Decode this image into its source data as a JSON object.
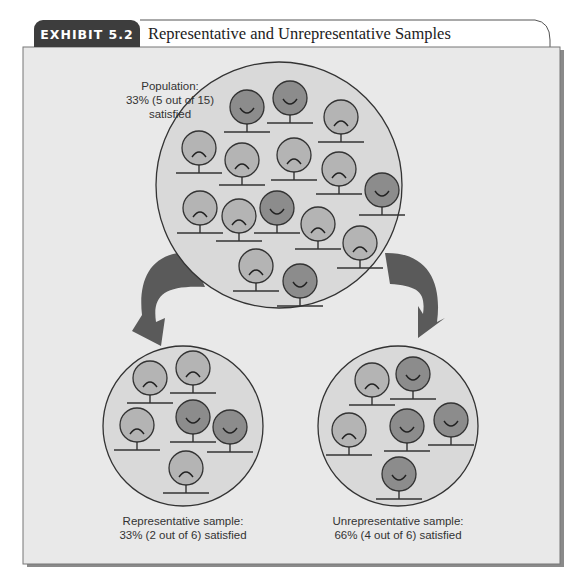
{
  "exhibit": {
    "tag": "EXHIBIT 5.2",
    "title": "Representative and Unrepresentative Samples"
  },
  "colors": {
    "tab": "#3d3d3d",
    "panel": "#e9e9e9",
    "circle_fill": "#d8d8d8",
    "satisfied_face": "#8c8c8c",
    "unsatisfied_face": "#b4b4b4",
    "arrow": "#5a5a5a"
  },
  "population": {
    "label_line1": "Population:",
    "label_line2": "33% (5 out of 15)",
    "label_line3": "satisfied",
    "total": 15,
    "satisfied": 5,
    "faces": [
      {
        "x": 247,
        "y": 107,
        "mood": "happy"
      },
      {
        "x": 290,
        "y": 98,
        "mood": "happy"
      },
      {
        "x": 341,
        "y": 117,
        "mood": "sad"
      },
      {
        "x": 199,
        "y": 148,
        "mood": "sad"
      },
      {
        "x": 242,
        "y": 160,
        "mood": "sad"
      },
      {
        "x": 294,
        "y": 155,
        "mood": "sad"
      },
      {
        "x": 339,
        "y": 169,
        "mood": "sad"
      },
      {
        "x": 382,
        "y": 190,
        "mood": "happy"
      },
      {
        "x": 200,
        "y": 208,
        "mood": "sad"
      },
      {
        "x": 239,
        "y": 216,
        "mood": "sad"
      },
      {
        "x": 277,
        "y": 208,
        "mood": "happy"
      },
      {
        "x": 318,
        "y": 224,
        "mood": "sad"
      },
      {
        "x": 360,
        "y": 243,
        "mood": "sad"
      },
      {
        "x": 256,
        "y": 266,
        "mood": "sad"
      },
      {
        "x": 300,
        "y": 281,
        "mood": "happy"
      }
    ]
  },
  "representative_sample": {
    "label_line1": "Representative sample:",
    "label_line2": "33% (2 out of 6) satisfied",
    "total": 6,
    "satisfied": 2,
    "faces": [
      {
        "x": 150,
        "y": 378,
        "mood": "sad"
      },
      {
        "x": 193,
        "y": 368,
        "mood": "sad"
      },
      {
        "x": 137,
        "y": 425,
        "mood": "sad"
      },
      {
        "x": 193,
        "y": 417,
        "mood": "happy"
      },
      {
        "x": 230,
        "y": 427,
        "mood": "happy"
      },
      {
        "x": 186,
        "y": 468,
        "mood": "sad"
      }
    ]
  },
  "unrepresentative_sample": {
    "label_line1": "Unrepresentative sample:",
    "label_line2": "66% (4 out of 6) satisfied",
    "total": 6,
    "satisfied": 4,
    "faces": [
      {
        "x": 372,
        "y": 380,
        "mood": "sad"
      },
      {
        "x": 413,
        "y": 374,
        "mood": "happy"
      },
      {
        "x": 349,
        "y": 430,
        "mood": "sad"
      },
      {
        "x": 407,
        "y": 426,
        "mood": "happy"
      },
      {
        "x": 451,
        "y": 420,
        "mood": "happy"
      },
      {
        "x": 399,
        "y": 474,
        "mood": "happy"
      }
    ]
  }
}
